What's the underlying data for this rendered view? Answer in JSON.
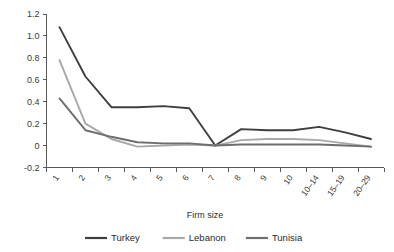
{
  "chart_data": {
    "type": "line",
    "title": "",
    "xlabel": "Firm size",
    "ylabel": "",
    "categories": [
      "1",
      "2",
      "3",
      "4",
      "5",
      "6",
      "7",
      "8",
      "9",
      "10",
      "10–14",
      "15–19",
      "20–29"
    ],
    "ylim": [
      -0.2,
      1.2
    ],
    "yticks": [
      "1.2",
      "1.0",
      "0.8",
      "0.6",
      "0.4",
      "0.2",
      "0",
      "-0.2"
    ],
    "ytick_values": [
      1.2,
      1.0,
      0.8,
      0.6,
      0.4,
      0.2,
      0,
      -0.2
    ],
    "grid": false,
    "legend_position": "bottom",
    "series": [
      {
        "name": "Turkey",
        "color": "#3f3f3f",
        "values": [
          1.08,
          0.63,
          0.35,
          0.35,
          0.36,
          0.34,
          0.0,
          0.15,
          0.14,
          0.14,
          0.17,
          0.12,
          0.06
        ]
      },
      {
        "name": "Lebanon",
        "color": "#a8a8a8",
        "values": [
          0.78,
          0.2,
          0.06,
          -0.01,
          0.0,
          0.01,
          0.0,
          0.05,
          0.06,
          0.06,
          0.05,
          0.02,
          -0.01
        ]
      },
      {
        "name": "Tunisia",
        "color": "#6e6e6e",
        "values": [
          0.43,
          0.14,
          0.08,
          0.03,
          0.02,
          0.02,
          0.0,
          0.01,
          0.01,
          0.01,
          0.01,
          0.0,
          -0.01
        ]
      }
    ]
  },
  "legend": {
    "items": [
      {
        "label": "Turkey",
        "color": "#3f3f3f"
      },
      {
        "label": "Lebanon",
        "color": "#a8a8a8"
      },
      {
        "label": "Tunisia",
        "color": "#6e6e6e"
      }
    ]
  },
  "axis": {
    "x_title": "Firm size"
  }
}
